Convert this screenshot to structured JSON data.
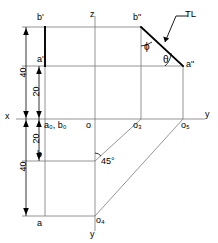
{
  "diagram": {
    "axes": {
      "x_label": "x",
      "z_label": "z",
      "y_right_label": "y",
      "y_bottom_label": "y"
    },
    "points": {
      "b_front": "b'",
      "a_front": "a'",
      "b_side": "b\"",
      "a_side": "a\"",
      "b_top": "b",
      "a_top": "a",
      "origin": "o",
      "a0_b0": "a₀, b₀",
      "o3": "o₃",
      "o4": "o₄",
      "o5": "o₅"
    },
    "annotations": {
      "true_length": "TL",
      "angle_phi": "ϕ",
      "angle_theta": "θ",
      "miter_angle": "45°"
    },
    "dimensions": {
      "upper_outer": "40",
      "upper_inner": "20",
      "lower_inner": "20",
      "lower_outer": "40"
    },
    "colors": {
      "line": "#000000",
      "thin_line": "#7a7a7a",
      "background": "#ffffff"
    }
  }
}
